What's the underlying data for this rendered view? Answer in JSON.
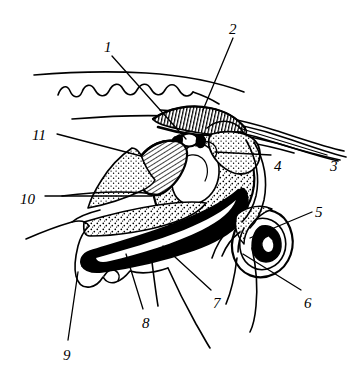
{
  "figure": {
    "kind": "anatomical-line-drawing",
    "background_color": "#ffffff",
    "ink_color": "#000000",
    "width": 360,
    "height": 373
  },
  "callouts": [
    {
      "id": "1",
      "label": "1",
      "x": 104,
      "y": 40,
      "leader": {
        "x1": 112,
        "y1": 56,
        "x2": 186,
        "y2": 139
      }
    },
    {
      "id": "2",
      "label": "2",
      "x": 229,
      "y": 22,
      "leader": {
        "x1": 233,
        "y1": 38,
        "x2": 203,
        "y2": 110
      }
    },
    {
      "id": "3",
      "label": "3",
      "x": 330,
      "y": 159,
      "leader": {
        "x1": 327,
        "y1": 155,
        "x2": 239,
        "y2": 128
      }
    },
    {
      "id": "4",
      "label": "4",
      "x": 274,
      "y": 159,
      "leader": {
        "x1": 271,
        "y1": 155,
        "x2": 215,
        "y2": 152
      }
    },
    {
      "id": "5",
      "label": "5",
      "x": 315,
      "y": 205,
      "leader": {
        "x1": 312,
        "y1": 212,
        "x2": 250,
        "y2": 238
      }
    },
    {
      "id": "6",
      "label": "6",
      "x": 304,
      "y": 296,
      "leader": {
        "x1": 301,
        "y1": 290,
        "x2": 243,
        "y2": 254
      }
    },
    {
      "id": "7",
      "label": "7",
      "x": 213,
      "y": 296,
      "leader": {
        "x1": 211,
        "y1": 290,
        "x2": 163,
        "y2": 246
      }
    },
    {
      "id": "8",
      "label": "8",
      "x": 142,
      "y": 316,
      "leader": {
        "x1": 143,
        "y1": 309,
        "x2": 126,
        "y2": 254
      }
    },
    {
      "id": "9",
      "label": "9",
      "x": 63,
      "y": 348,
      "leader": {
        "x1": 68,
        "y1": 340,
        "x2": 78,
        "y2": 272
      }
    },
    {
      "id": "10",
      "label": "10",
      "x": 20,
      "y": 192,
      "leader": {
        "x1": 45,
        "y1": 196,
        "x2": 152,
        "y2": 196
      }
    },
    {
      "id": "11",
      "label": "11",
      "x": 32,
      "y": 128,
      "leader": {
        "x1": 57,
        "y1": 134,
        "x2": 141,
        "y2": 156
      }
    }
  ],
  "structures": [
    {
      "name": "dorsal-scalloped-crest",
      "note": "wavy scalloped outline across the upper left"
    },
    {
      "name": "parallel-dorsal-lines",
      "note": "several long parallel curves sweeping to the upper right"
    },
    {
      "name": "striated-ridge",
      "note": "hatched comb-like ridge indicated by callout 2"
    },
    {
      "name": "stippled-mass",
      "note": "large oval stippled body in the centre"
    },
    {
      "name": "fan-hatched-ampulla",
      "note": "fan shaped line-hatched wedge indicated by callout 11"
    },
    {
      "name": "small-white-ossicle",
      "note": "small unfilled oval above the stippled mass"
    },
    {
      "name": "solid-black-canal",
      "note": "broad solid black channel running down to the lower left"
    },
    {
      "name": "spiral-cochlea",
      "note": "coiled spiral structure at the right, callouts 5 and 6"
    },
    {
      "name": "ventral-outline",
      "note": "outer body wall outline enclosing the section"
    },
    {
      "name": "trailing-filaments",
      "note": "free curved lines descending at the lower right"
    }
  ]
}
